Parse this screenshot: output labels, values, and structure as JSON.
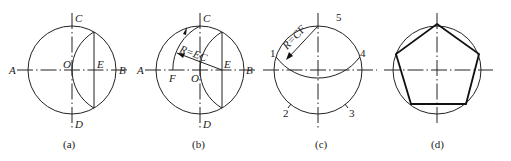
{
  "figures": [
    {
      "id": "a",
      "caption": "(a)",
      "labels": {
        "A": "A",
        "B": "B",
        "C": "C",
        "D": "D",
        "O": "O",
        "E": "E"
      }
    },
    {
      "id": "b",
      "caption": "(b)",
      "labels": {
        "A": "A",
        "B": "B",
        "C": "C",
        "D": "D",
        "O": "O",
        "E": "E",
        "F": "F"
      },
      "radius_label": "R=EC"
    },
    {
      "id": "c",
      "caption": "(c)",
      "points": [
        "1",
        "2",
        "3",
        "4",
        "5"
      ],
      "radius_label": "R=CF"
    },
    {
      "id": "d",
      "caption": "(d)",
      "shape": "regular pentagon"
    }
  ],
  "colors": {
    "line": "#222222",
    "background": "#ffffff"
  }
}
